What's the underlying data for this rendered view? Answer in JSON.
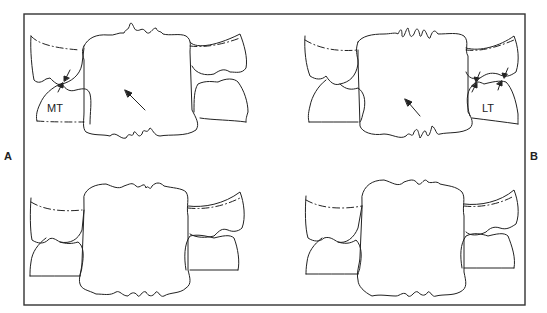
{
  "figure": {
    "panels": [
      {
        "id": "A",
        "label": "A"
      },
      {
        "id": "B",
        "label": "B"
      }
    ],
    "annotations": {
      "mt": "MT",
      "lt": "LT"
    },
    "colors": {
      "line": "#222222",
      "frame": "#333333",
      "background": "#ffffff"
    }
  }
}
